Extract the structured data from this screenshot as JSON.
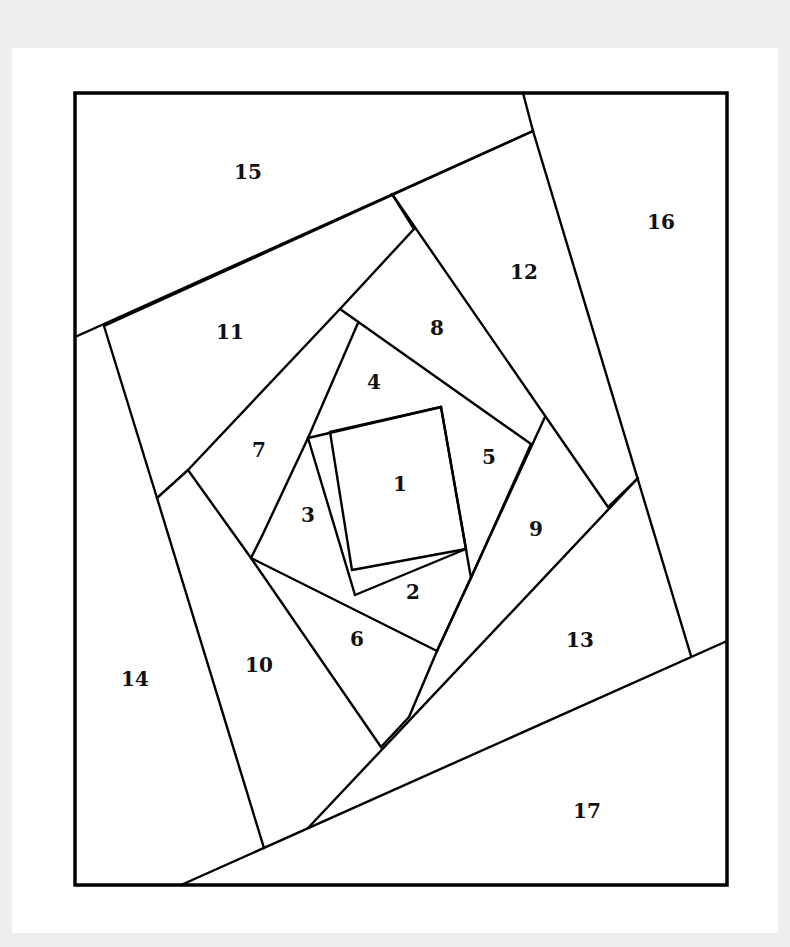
{
  "diagram": {
    "type": "paper-piecing pattern",
    "colors": {
      "background": "#efefef",
      "page": "#ffffff",
      "line": "#000000",
      "text": "#111111"
    },
    "frame": {
      "x1": 75,
      "y1": 93,
      "x2": 727,
      "y2": 885
    },
    "seams": [
      {
        "id": "s1",
        "x1": 330,
        "y1": 432,
        "x2": 441,
        "y2": 407
      },
      {
        "id": "s2",
        "x1": 441,
        "y1": 407,
        "x2": 466,
        "y2": 549
      },
      {
        "id": "s3",
        "x1": 466,
        "y1": 549,
        "x2": 352,
        "y2": 570
      },
      {
        "id": "s4",
        "x1": 352,
        "y1": 570,
        "x2": 330,
        "y2": 432
      },
      {
        "id": "s5",
        "x1": 308,
        "y1": 438,
        "x2": 441,
        "y2": 407
      },
      {
        "id": "s6",
        "x1": 466,
        "y1": 549,
        "x2": 355,
        "y2": 595
      },
      {
        "id": "s7",
        "x1": 308,
        "y1": 438,
        "x2": 355,
        "y2": 595
      },
      {
        "id": "s8",
        "x1": 358,
        "y1": 323,
        "x2": 308,
        "y2": 438
      },
      {
        "id": "s9",
        "x1": 441,
        "y1": 407,
        "x2": 471,
        "y2": 578
      },
      {
        "id": "s10",
        "x1": 340,
        "y1": 309,
        "x2": 531,
        "y2": 444
      },
      {
        "id": "s11",
        "x1": 531,
        "y1": 444,
        "x2": 471,
        "y2": 578
      },
      {
        "id": "s12",
        "x1": 262,
        "y1": 536,
        "x2": 308,
        "y2": 438
      },
      {
        "id": "s13",
        "x1": 251,
        "y1": 558,
        "x2": 437,
        "y2": 651
      },
      {
        "id": "s14",
        "x1": 262,
        "y1": 536,
        "x2": 251,
        "y2": 558
      },
      {
        "id": "s15",
        "x1": 471,
        "y1": 578,
        "x2": 437,
        "y2": 651
      },
      {
        "id": "s16",
        "x1": 188,
        "y1": 470,
        "x2": 340,
        "y2": 309
      },
      {
        "id": "s17",
        "x1": 188,
        "y1": 470,
        "x2": 251,
        "y2": 558
      },
      {
        "id": "s18",
        "x1": 340,
        "y1": 309,
        "x2": 414,
        "y2": 229
      },
      {
        "id": "s19",
        "x1": 392,
        "y1": 194,
        "x2": 608,
        "y2": 507
      },
      {
        "id": "s20",
        "x1": 545,
        "y1": 417,
        "x2": 437,
        "y2": 651
      },
      {
        "id": "s21",
        "x1": 437,
        "y1": 651,
        "x2": 409,
        "y2": 717
      },
      {
        "id": "s22",
        "x1": 157,
        "y1": 498,
        "x2": 188,
        "y2": 470
      },
      {
        "id": "s23",
        "x1": 414,
        "y1": 229,
        "x2": 392,
        "y2": 194
      },
      {
        "id": "s24",
        "x1": 157,
        "y1": 498,
        "x2": 104,
        "y2": 326
      },
      {
        "id": "s25",
        "x1": 104,
        "y1": 326,
        "x2": 533,
        "y2": 131
      },
      {
        "id": "s26",
        "x1": 75,
        "y1": 337,
        "x2": 533,
        "y2": 131
      },
      {
        "id": "s27",
        "x1": 533,
        "y1": 131,
        "x2": 523,
        "y2": 93
      },
      {
        "id": "s28",
        "x1": 533,
        "y1": 131,
        "x2": 691,
        "y2": 656
      },
      {
        "id": "s29",
        "x1": 608,
        "y1": 507,
        "x2": 638,
        "y2": 478
      },
      {
        "id": "s30",
        "x1": 638,
        "y1": 478,
        "x2": 308,
        "y2": 828
      },
      {
        "id": "s31",
        "x1": 157,
        "y1": 498,
        "x2": 264,
        "y2": 848
      },
      {
        "id": "s32",
        "x1": 251,
        "y1": 558,
        "x2": 381,
        "y2": 747
      },
      {
        "id": "s33",
        "x1": 409,
        "y1": 717,
        "x2": 381,
        "y2": 747
      },
      {
        "id": "s34",
        "x1": 181,
        "y1": 885,
        "x2": 727,
        "y2": 641
      }
    ],
    "pieces": [
      {
        "label": "1",
        "x": 400,
        "y": 485
      },
      {
        "label": "2",
        "x": 413,
        "y": 593
      },
      {
        "label": "3",
        "x": 308,
        "y": 516
      },
      {
        "label": "4",
        "x": 374,
        "y": 383
      },
      {
        "label": "5",
        "x": 489,
        "y": 458
      },
      {
        "label": "6",
        "x": 357,
        "y": 640
      },
      {
        "label": "7",
        "x": 259,
        "y": 451
      },
      {
        "label": "8",
        "x": 437,
        "y": 329
      },
      {
        "label": "9",
        "x": 536,
        "y": 530
      },
      {
        "label": "10",
        "x": 259,
        "y": 666
      },
      {
        "label": "11",
        "x": 230,
        "y": 333
      },
      {
        "label": "12",
        "x": 524,
        "y": 273
      },
      {
        "label": "13",
        "x": 580,
        "y": 641
      },
      {
        "label": "14",
        "x": 135,
        "y": 680
      },
      {
        "label": "15",
        "x": 248,
        "y": 173
      },
      {
        "label": "16",
        "x": 661,
        "y": 223
      },
      {
        "label": "17",
        "x": 587,
        "y": 812
      }
    ]
  }
}
